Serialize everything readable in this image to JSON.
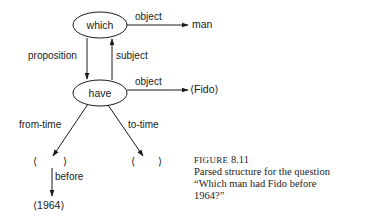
{
  "diagram": {
    "nodes": {
      "which": "which",
      "have": "have"
    },
    "edges": {
      "which_object": "object",
      "proposition": "proposition",
      "subject": "subject",
      "have_object": "object",
      "from_time": "from-time",
      "to_time": "to-time",
      "before": "before"
    },
    "targets": {
      "man": "man",
      "fido": "⟨Fido⟩",
      "from_slot_open": "⟨",
      "from_slot_close": "⟩",
      "to_slot_open": "⟨",
      "to_slot_close": "⟩",
      "year": "⟨1964⟩"
    }
  },
  "caption": {
    "figure_word": "FIGURE",
    "figure_number": "8.11",
    "line1": "Parsed structure for the question",
    "line2": "“Which man had Fido before",
    "line3": "1964?”"
  },
  "colors": {
    "ink": "#1a1a1a",
    "background": "#ffffff"
  }
}
